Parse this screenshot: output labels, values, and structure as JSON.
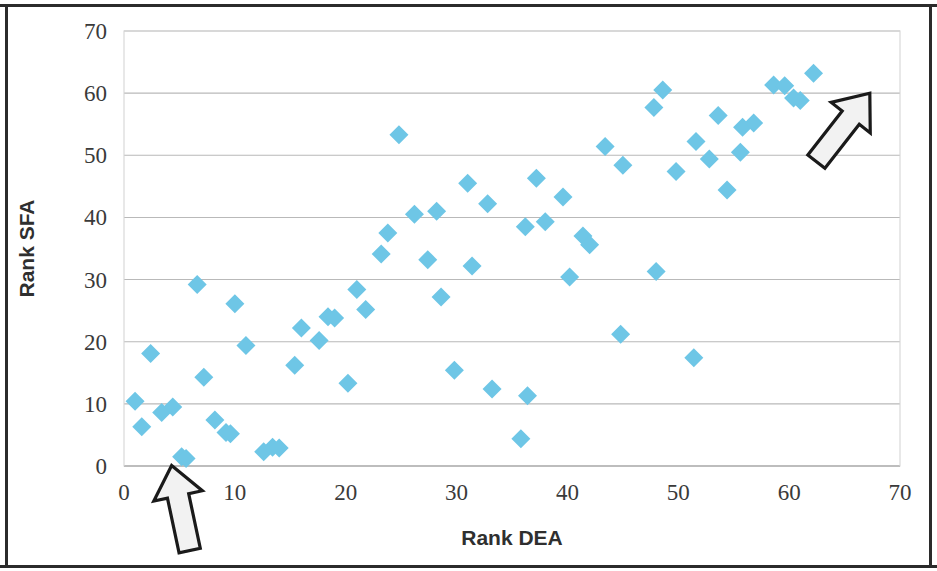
{
  "chart_data": {
    "type": "scatter",
    "title": "",
    "xlabel": "Rank DEA",
    "ylabel": "Rank SFA",
    "xlim": [
      0,
      70
    ],
    "ylim": [
      0,
      70
    ],
    "xticks": [
      0,
      10,
      20,
      30,
      40,
      50,
      60,
      70
    ],
    "yticks": [
      0,
      10,
      20,
      30,
      40,
      50,
      60,
      70
    ],
    "xtick_labels": [
      "0",
      "10",
      "20",
      "30",
      "40",
      "50",
      "60",
      "70"
    ],
    "ytick_labels": [
      "0",
      "10",
      "20",
      "30",
      "40",
      "50",
      "60",
      "70"
    ],
    "grid": "horizontal",
    "legend": "none",
    "marker": "diamond",
    "marker_color": "#6ec6e6",
    "series": [
      {
        "name": "Rank SFA vs Rank DEA",
        "points": [
          [
            1.0,
            10.4
          ],
          [
            1.6,
            6.3
          ],
          [
            2.4,
            18.1
          ],
          [
            3.4,
            8.6
          ],
          [
            4.4,
            9.5
          ],
          [
            5.2,
            1.5
          ],
          [
            5.6,
            1.2
          ],
          [
            6.6,
            29.2
          ],
          [
            7.2,
            14.3
          ],
          [
            8.2,
            7.4
          ],
          [
            9.2,
            5.4
          ],
          [
            9.6,
            5.2
          ],
          [
            10.0,
            26.1
          ],
          [
            11.0,
            19.4
          ],
          [
            12.6,
            2.3
          ],
          [
            13.4,
            3.0
          ],
          [
            14.0,
            2.9
          ],
          [
            15.4,
            16.2
          ],
          [
            16.0,
            22.2
          ],
          [
            17.6,
            20.2
          ],
          [
            18.4,
            24.0
          ],
          [
            19.0,
            23.8
          ],
          [
            20.2,
            13.3
          ],
          [
            21.0,
            28.4
          ],
          [
            21.8,
            25.2
          ],
          [
            23.2,
            34.1
          ],
          [
            23.8,
            37.5
          ],
          [
            24.8,
            53.3
          ],
          [
            26.2,
            40.5
          ],
          [
            27.4,
            33.2
          ],
          [
            28.2,
            41.0
          ],
          [
            28.6,
            27.2
          ],
          [
            29.8,
            15.4
          ],
          [
            31.0,
            45.5
          ],
          [
            31.4,
            32.2
          ],
          [
            32.8,
            42.2
          ],
          [
            33.2,
            12.4
          ],
          [
            35.8,
            4.4
          ],
          [
            36.2,
            38.5
          ],
          [
            36.4,
            11.3
          ],
          [
            37.2,
            46.3
          ],
          [
            38.0,
            39.3
          ],
          [
            39.6,
            43.3
          ],
          [
            40.2,
            30.4
          ],
          [
            41.4,
            37.0
          ],
          [
            42.0,
            35.6
          ],
          [
            43.4,
            51.4
          ],
          [
            44.8,
            21.2
          ],
          [
            45.0,
            48.4
          ],
          [
            47.8,
            57.7
          ],
          [
            48.0,
            31.3
          ],
          [
            48.6,
            60.5
          ],
          [
            49.8,
            47.4
          ],
          [
            51.4,
            17.4
          ],
          [
            51.6,
            52.2
          ],
          [
            52.8,
            49.4
          ],
          [
            53.6,
            56.4
          ],
          [
            54.4,
            44.4
          ],
          [
            55.6,
            50.5
          ],
          [
            55.8,
            54.5
          ],
          [
            56.8,
            55.2
          ],
          [
            58.6,
            61.3
          ],
          [
            59.6,
            61.2
          ],
          [
            60.4,
            59.2
          ],
          [
            61.0,
            58.8
          ],
          [
            62.2,
            63.2
          ]
        ]
      }
    ],
    "annotations": [
      {
        "name": "lower-left-arrow",
        "shape": "arrow",
        "direction": "up-left",
        "target_point": [
          2,
          0
        ],
        "label": ""
      },
      {
        "name": "upper-right-arrow",
        "shape": "arrow",
        "direction": "up-left",
        "target_point": [
          60,
          57
        ],
        "label": ""
      }
    ]
  }
}
